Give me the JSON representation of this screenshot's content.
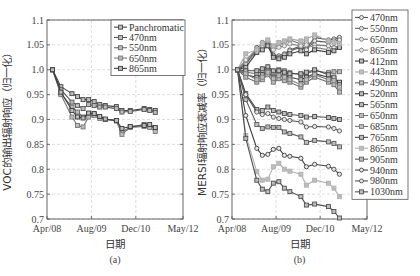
{
  "chart_data": [
    {
      "type": "line",
      "panel": "(a)",
      "title": "",
      "xlabel": "日期",
      "ylabel": "VOC的输出辐射响应（归一化）",
      "x_ticks": [
        "Apr/08",
        "Aug/09",
        "Dec/10",
        "May/12"
      ],
      "x_tick_months": [
        0,
        16,
        32,
        49
      ],
      "y_ticks": [
        "0.7",
        "0.75",
        "0.8",
        "0.85",
        "0.9",
        "0.95",
        "1.0",
        "1.05",
        "1.1"
      ],
      "ylim": [
        0.7,
        1.1
      ],
      "xlim_months": [
        0,
        49
      ],
      "grid": true,
      "legend_position": "upper right",
      "x_months": [
        2,
        5,
        9,
        11,
        13,
        15,
        17,
        19,
        21,
        25,
        27,
        30,
        35,
        37,
        39
      ],
      "series": [
        {
          "name": "Panchromatic",
          "color": "#444444",
          "values": [
            1.0,
            0.966,
            0.952,
            0.946,
            0.94,
            0.94,
            0.936,
            0.93,
            0.928,
            0.926,
            0.918,
            0.918,
            0.922,
            0.92,
            0.918
          ]
        },
        {
          "name": "470nm",
          "color": "#555555",
          "values": [
            1.0,
            0.96,
            0.935,
            0.928,
            0.922,
            0.93,
            0.928,
            0.925,
            0.925,
            0.922,
            0.915,
            0.916,
            0.92,
            0.918,
            0.914
          ]
        },
        {
          "name": "550nm",
          "color": "#666666",
          "values": [
            1.0,
            0.952,
            0.925,
            0.915,
            0.905,
            0.912,
            0.91,
            0.905,
            0.9,
            0.898,
            0.875,
            0.885,
            0.89,
            0.886,
            0.882
          ]
        },
        {
          "name": "650nm",
          "color": "#777777",
          "values": [
            1.0,
            0.95,
            0.905,
            0.888,
            0.885,
            0.905,
            0.908,
            0.902,
            0.9,
            0.897,
            0.87,
            0.884,
            0.886,
            0.884,
            0.876
          ]
        },
        {
          "name": "865nm",
          "color": "#3a3a3a",
          "values": [
            1.0,
            0.955,
            0.918,
            0.905,
            0.903,
            0.913,
            0.912,
            0.906,
            0.901,
            0.898,
            0.882,
            0.886,
            0.888,
            0.89,
            0.884
          ]
        }
      ]
    },
    {
      "type": "line",
      "panel": "(b)",
      "title": "",
      "xlabel": "日期",
      "ylabel": "MERSI辐射响应衰减率（归一化）",
      "x_ticks": [
        "Apr/08",
        "Aug/09",
        "Dec/10",
        "May/12"
      ],
      "x_tick_months": [
        0,
        16,
        32,
        49
      ],
      "y_ticks": [
        "0.7",
        "0.75",
        "0.8",
        "0.85",
        "0.9",
        "0.95",
        "1.0",
        "1.05",
        "1.1"
      ],
      "ylim": [
        0.7,
        1.1
      ],
      "xlim_months": [
        0,
        49
      ],
      "grid": true,
      "legend_position": "right outside",
      "x_months": [
        2,
        5,
        9,
        11,
        13,
        15,
        17,
        19,
        21,
        25,
        27,
        30,
        35,
        37,
        39
      ],
      "series": [
        {
          "name": "470nm",
          "marker": "circle",
          "color": "#555555",
          "values": [
            1.0,
            1.01,
            1.045,
            1.05,
            1.055,
            1.03,
            1.028,
            1.032,
            1.04,
            1.048,
            1.042,
            1.065,
            1.06,
            1.062,
            1.065
          ]
        },
        {
          "name": "550nm",
          "marker": "circle",
          "color": "#606060",
          "values": [
            1.0,
            1.012,
            1.04,
            1.048,
            1.05,
            1.028,
            1.025,
            1.03,
            1.038,
            1.045,
            1.04,
            1.058,
            1.055,
            1.058,
            1.06
          ]
        },
        {
          "name": "650nm",
          "marker": "circle",
          "color": "#777777",
          "values": [
            1.0,
            1.018,
            1.035,
            1.055,
            1.058,
            1.045,
            1.05,
            1.055,
            1.06,
            1.052,
            1.055,
            1.05,
            1.048,
            1.045,
            1.048
          ]
        },
        {
          "name": "865nm",
          "marker": "circle",
          "color": "#888888",
          "values": [
            1.0,
            1.02,
            1.042,
            1.045,
            1.05,
            1.04,
            1.045,
            1.048,
            1.052,
            1.048,
            1.05,
            1.045,
            1.04,
            1.044,
            1.046
          ]
        },
        {
          "name": "412nm",
          "marker": "square",
          "color": "#3a3a3a",
          "values": [
            1.0,
            1.005,
            1.035,
            1.04,
            1.048,
            1.025,
            1.022,
            1.025,
            1.032,
            1.038,
            1.032,
            1.04,
            1.035,
            1.038,
            1.045
          ]
        },
        {
          "name": "443nm",
          "marker": "square",
          "color": "#a8a8a8",
          "values": [
            1.0,
            1.032,
            1.04,
            1.052,
            1.06,
            1.048,
            1.055,
            1.058,
            1.062,
            1.058,
            1.062,
            1.07,
            1.058,
            1.055,
            1.052
          ]
        },
        {
          "name": "490nm",
          "marker": "square",
          "color": "#666666",
          "values": [
            1.0,
            0.995,
            0.992,
            0.998,
            1.002,
            0.995,
            1.0,
            0.998,
            0.994,
            0.99,
            0.992,
            0.998,
            0.994,
            0.996,
            0.996
          ]
        },
        {
          "name": "520nm",
          "marker": "square",
          "color": "#3c3c3c",
          "values": [
            1.0,
            0.99,
            0.985,
            0.99,
            0.995,
            0.985,
            0.99,
            0.988,
            0.985,
            0.98,
            0.985,
            0.992,
            0.985,
            0.982,
            0.975
          ]
        },
        {
          "name": "565nm",
          "marker": "square",
          "color": "#444444",
          "values": [
            1.0,
            0.998,
            0.998,
            1.002,
            1.006,
            0.998,
            0.998,
            0.995,
            0.992,
            0.992,
            0.995,
            1.0,
            0.99,
            0.985,
            0.97
          ]
        },
        {
          "name": "650nm",
          "marker": "square",
          "color": "#707070",
          "values": [
            1.0,
            0.985,
            0.975,
            0.98,
            0.99,
            0.975,
            0.982,
            0.978,
            0.975,
            0.965,
            0.975,
            0.985,
            0.975,
            0.97,
            0.955
          ]
        },
        {
          "name": "685nm",
          "marker": "square",
          "color": "#7a7a7a",
          "values": [
            1.0,
            0.992,
            0.98,
            0.985,
            0.995,
            0.982,
            0.988,
            0.985,
            0.98,
            0.97,
            0.98,
            0.99,
            0.98,
            0.978,
            0.965
          ]
        },
        {
          "name": "765nm",
          "marker": "square",
          "color": "#4a4a4a",
          "values": [
            1.0,
            0.952,
            0.92,
            0.918,
            0.925,
            0.918,
            0.915,
            0.912,
            0.91,
            0.908,
            0.905,
            0.906,
            0.904,
            0.902,
            0.9
          ]
        },
        {
          "name": "865nm",
          "marker": "square",
          "color": "#b0b0b0",
          "values": [
            1.0,
            0.868,
            0.795,
            0.778,
            0.78,
            0.805,
            0.812,
            0.8,
            0.796,
            0.79,
            0.768,
            0.778,
            0.772,
            0.762,
            0.745
          ]
        },
        {
          "name": "905nm",
          "marker": "square",
          "color": "#5a5a5a",
          "values": [
            1.0,
            0.94,
            0.89,
            0.882,
            0.885,
            0.884,
            0.884,
            0.875,
            0.872,
            0.865,
            0.854,
            0.858,
            0.855,
            0.852,
            0.845
          ]
        },
        {
          "name": "940nm",
          "marker": "circle",
          "color": "#404040",
          "values": [
            1.0,
            0.908,
            0.842,
            0.828,
            0.83,
            0.84,
            0.842,
            0.828,
            0.826,
            0.822,
            0.805,
            0.81,
            0.806,
            0.8,
            0.79
          ]
        },
        {
          "name": "980nm",
          "marker": "circle",
          "color": "#505050",
          "values": [
            1.0,
            0.95,
            0.915,
            0.91,
            0.912,
            0.905,
            0.902,
            0.9,
            0.898,
            0.895,
            0.885,
            0.886,
            0.885,
            0.882,
            0.877
          ]
        },
        {
          "name": "1030nm",
          "marker": "square",
          "color": "#505050",
          "values": [
            1.0,
            0.862,
            0.778,
            0.76,
            0.755,
            0.772,
            0.775,
            0.762,
            0.755,
            0.745,
            0.728,
            0.73,
            0.725,
            0.715,
            0.702
          ]
        }
      ]
    }
  ]
}
